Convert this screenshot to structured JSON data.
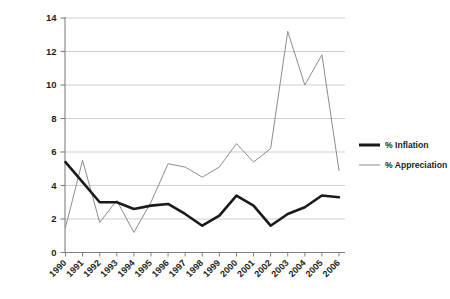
{
  "chart_data": {
    "type": "line",
    "title": "",
    "xlabel": "",
    "ylabel": "",
    "grid": true,
    "legend_position": "right",
    "ylim": [
      0,
      14
    ],
    "yticks": [
      0,
      2,
      4,
      6,
      8,
      10,
      12,
      14
    ],
    "categories": [
      "1990",
      "1991",
      "1992",
      "1993",
      "1994",
      "1995",
      "1996",
      "1997",
      "1998",
      "1999",
      "2000",
      "2001",
      "2002",
      "2003",
      "2004",
      "2005",
      "2006"
    ],
    "series": [
      {
        "name": "% Inflation",
        "color": "#1a1a1a",
        "width": 2.6,
        "values": [
          5.4,
          4.2,
          3.0,
          3.0,
          2.6,
          2.8,
          2.9,
          2.3,
          1.6,
          2.2,
          3.4,
          2.8,
          1.6,
          2.3,
          2.7,
          3.4,
          3.3
        ]
      },
      {
        "name": "% Appreciation",
        "color": "#8c8c8c",
        "width": 1.0,
        "values": [
          1.5,
          5.5,
          1.8,
          3.1,
          1.2,
          3.0,
          5.3,
          5.1,
          4.5,
          5.1,
          6.5,
          5.4,
          6.2,
          13.2,
          10.0,
          11.8,
          4.9
        ]
      }
    ]
  },
  "axes": {
    "y_tick_labels": [
      "14",
      "12",
      "10",
      "8",
      "6",
      "4",
      "2",
      "0"
    ],
    "x_tick_labels": [
      "1990",
      "1991",
      "1992",
      "1993",
      "1994",
      "1995",
      "1996",
      "1997",
      "1998",
      "1999",
      "2000",
      "2001",
      "2002",
      "2003",
      "2004",
      "2005",
      "2006"
    ]
  },
  "legend": {
    "items": [
      {
        "label": "% Inflation",
        "color": "#1a1a1a",
        "thickness": 3
      },
      {
        "label": "% Appreciation",
        "color": "#8c8c8c",
        "thickness": 1
      }
    ]
  },
  "colors": {
    "gridline": "#c9c9c9",
    "axis": "#808080",
    "background": "#ffffff",
    "text": "#231f20"
  }
}
